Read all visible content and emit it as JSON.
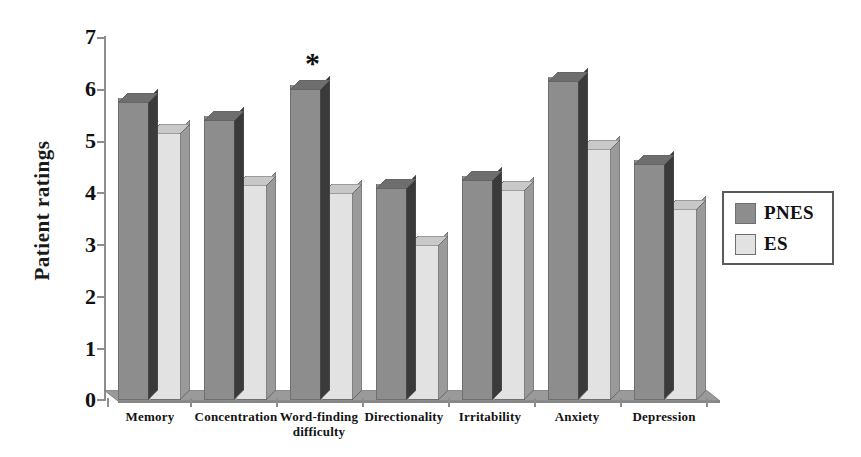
{
  "chart_data": {
    "type": "bar",
    "title": "",
    "subtitle": "",
    "xlabel": "",
    "ylabel": "Patient ratings",
    "ylim": [
      0,
      7
    ],
    "yticks": [
      0,
      1,
      2,
      3,
      4,
      5,
      6,
      7
    ],
    "ytick_labels": [
      "0",
      "1",
      "2",
      "3",
      "4",
      "5",
      "6",
      "7"
    ],
    "grid": false,
    "legend_position": "right",
    "style": "3d-bar",
    "categories": [
      "Memory",
      "Concentration",
      "Word-finding difficulty",
      "Directionality",
      "Irritability",
      "Anxiety",
      "Depression"
    ],
    "series": [
      {
        "name": "PNES",
        "color": "#8d8d8d",
        "values": [
          5.8,
          5.45,
          6.05,
          4.15,
          4.3,
          6.2,
          4.6
        ]
      },
      {
        "name": "ES",
        "color": "#e2e2e2",
        "values": [
          5.2,
          4.2,
          4.05,
          3.05,
          4.1,
          4.9,
          3.75
        ]
      }
    ],
    "annotations": [
      {
        "symbol": "*",
        "category": "Word-finding difficulty",
        "series": "PNES",
        "meaning": "significant difference"
      }
    ]
  },
  "legend": {
    "entries": [
      {
        "label": "PNES",
        "color": "#8d8d8d"
      },
      {
        "label": "ES",
        "color": "#e2e2e2"
      }
    ]
  },
  "axis": {
    "y_title": "Patient ratings",
    "y_labels": [
      "7",
      "6",
      "5",
      "4",
      "3",
      "2",
      "1",
      "0"
    ],
    "x_labels": [
      {
        "line1": "Memory",
        "line2": ""
      },
      {
        "line1": "Concentration",
        "line2": ""
      },
      {
        "line1": "Word-finding",
        "line2": "difficulty"
      },
      {
        "line1": "Directionality",
        "line2": ""
      },
      {
        "line1": "Irritability",
        "line2": ""
      },
      {
        "line1": "Anxiety",
        "line2": ""
      },
      {
        "line1": "Depression",
        "line2": ""
      }
    ]
  },
  "annotation": {
    "star": "*"
  }
}
